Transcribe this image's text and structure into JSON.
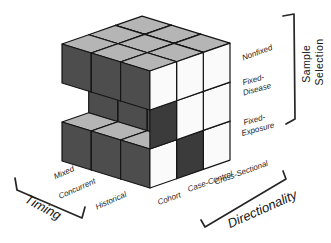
{
  "figure": {
    "background": "#ffffff",
    "cube": {
      "grid_size": 3,
      "colors": {
        "top": "#b5b5b5",
        "left": "#4d4d4d",
        "right": "#fafafa",
        "shadow": "#3b3b3b",
        "outline": "#151515"
      },
      "present_cells": [
        [
          0,
          0,
          0
        ],
        [
          1,
          0,
          0
        ],
        [
          2,
          0,
          0
        ],
        [
          0,
          1,
          0
        ],
        [
          1,
          1,
          0
        ],
        [
          2,
          1,
          0
        ],
        [
          0,
          2,
          0
        ],
        [
          1,
          2,
          0
        ],
        [
          2,
          2,
          0
        ],
        [
          0,
          1,
          1
        ],
        [
          1,
          1,
          1
        ],
        [
          2,
          1,
          1
        ],
        [
          0,
          2,
          1
        ],
        [
          1,
          2,
          1
        ],
        [
          2,
          2,
          1
        ],
        [
          0,
          0,
          2
        ],
        [
          1,
          0,
          2
        ],
        [
          2,
          0,
          2
        ],
        [
          0,
          1,
          2
        ],
        [
          1,
          1,
          2
        ],
        [
          0,
          2,
          2
        ],
        [
          1,
          2,
          2
        ],
        [
          2,
          2,
          2
        ]
      ],
      "shadow_cells": [
        [
          2,
          0,
          1
        ],
        [
          2,
          1,
          2
        ]
      ]
    }
  },
  "labels": {
    "timing": {
      "title": "Timing",
      "ticks": [
        "Mixed",
        "Concurrent",
        "Historical"
      ]
    },
    "directionality": {
      "title": "Directionality",
      "ticks": [
        "Cohort",
        "Case-Control",
        "Cross-Sectional"
      ]
    },
    "sample_selection": {
      "title": [
        "Sample",
        "Selection"
      ],
      "ticks": [
        [
          "Nonfixed",
          ""
        ],
        [
          "Fixed-",
          "Disease"
        ],
        [
          "Fixed-",
          "Exposure"
        ]
      ]
    }
  }
}
